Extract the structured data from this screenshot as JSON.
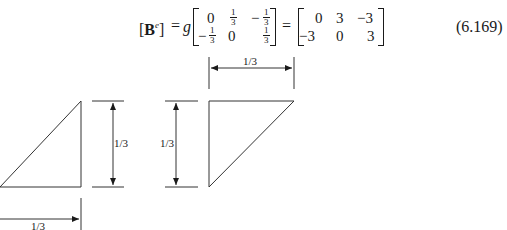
{
  "equation": {
    "lhs_bracket_open": "[",
    "lhs_symbol": "B",
    "lhs_superscript": "e",
    "lhs_bracket_close": "]",
    "equals_1": "=",
    "scalar": "g",
    "matrix_1": {
      "rows": [
        [
          {
            "sign": "",
            "value": "0",
            "type": "int"
          },
          {
            "sign": "",
            "num": "1",
            "den": "3",
            "type": "frac"
          },
          {
            "sign": "−",
            "num": "1",
            "den": "3",
            "type": "frac"
          }
        ],
        [
          {
            "sign": "−",
            "num": "1",
            "den": "3",
            "type": "frac"
          },
          {
            "sign": "",
            "value": "0",
            "type": "int"
          },
          {
            "sign": "",
            "num": "1",
            "den": "3",
            "type": "frac"
          }
        ]
      ]
    },
    "equals_2": "=",
    "matrix_2": {
      "rows": [
        [
          "0",
          "3",
          "−3"
        ],
        [
          "−3",
          "0",
          "3"
        ]
      ]
    },
    "number": "(6.169)"
  },
  "figures": {
    "left_triangle": {
      "width_label": "1/3",
      "height_label": "1/3"
    },
    "right_triangle": {
      "width_label": "1/3",
      "height_label": "1/3"
    }
  }
}
